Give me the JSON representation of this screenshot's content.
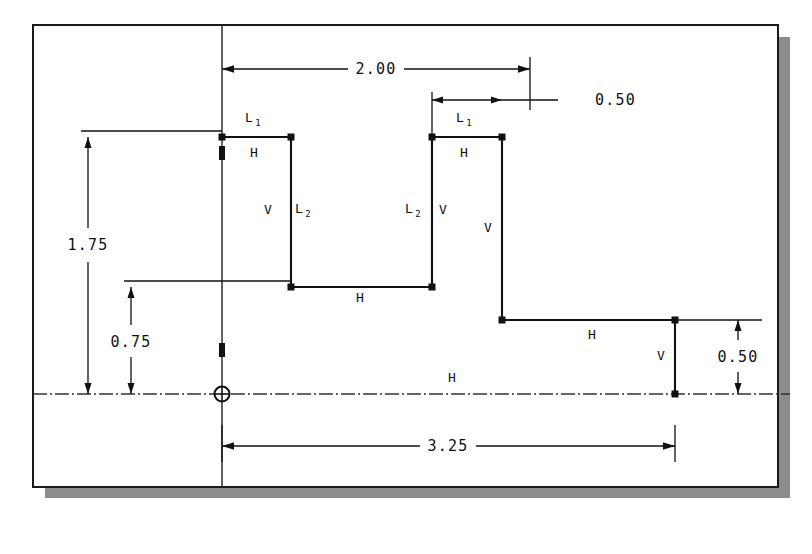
{
  "canvas": {
    "width": 812,
    "height": 554,
    "background": "#ffffff"
  },
  "window_frame": {
    "name": "cad-sketch-window",
    "border_color": "#1a1a1a",
    "shadow_color": "#8c8c8c",
    "x": 33,
    "y": 25,
    "width": 745,
    "height": 462,
    "shadow_offset": 12
  },
  "drawing": {
    "line_color": "#111111",
    "centerline_color": "#333333",
    "origin": {
      "x": 222,
      "y": 394,
      "label": "origin-symbol"
    },
    "axis_vertical": {
      "x": 222,
      "y1": 25,
      "y2": 487
    },
    "centerline_horizontal": {
      "y": 394,
      "x1": 33,
      "x2": 790
    },
    "profile_points": [
      {
        "x": 222,
        "y": 137
      },
      {
        "x": 291,
        "y": 137
      },
      {
        "x": 291,
        "y": 287
      },
      {
        "x": 432,
        "y": 287
      },
      {
        "x": 432,
        "y": 137
      },
      {
        "x": 502,
        "y": 137
      },
      {
        "x": 502,
        "y": 320
      },
      {
        "x": 675,
        "y": 320
      },
      {
        "x": 675,
        "y": 394
      }
    ]
  },
  "dimensions": [
    {
      "id": "dim-2-00",
      "label": "2.00",
      "orientation": "horizontal",
      "from_x": 222,
      "to_x": 530,
      "line_y": 69,
      "text_x": 376,
      "text_y": 74
    },
    {
      "id": "dim-0-50-top",
      "label": "0.50",
      "orientation": "horizontal",
      "from_x": 432,
      "to_x": 502,
      "line_y": 100,
      "text_x": 595,
      "text_y": 105,
      "leader_to_x": 558
    },
    {
      "id": "dim-1-75",
      "label": "1.75",
      "orientation": "vertical",
      "line_x": 88,
      "from_y": 137,
      "to_y": 394,
      "text_x": 88,
      "text_y": 248
    },
    {
      "id": "dim-0-75",
      "label": "0.75",
      "orientation": "vertical",
      "line_x": 131,
      "from_y": 287,
      "to_y": 394,
      "text_x": 131,
      "text_y": 345
    },
    {
      "id": "dim-3-25",
      "label": "3.25",
      "orientation": "horizontal",
      "from_x": 222,
      "to_x": 675,
      "line_y": 446,
      "text_x": 448,
      "text_y": 451
    },
    {
      "id": "dim-0-50-right",
      "label": "0.50",
      "orientation": "vertical",
      "line_x": 738,
      "from_y": 320,
      "to_y": 394,
      "text_x": 738,
      "text_y": 359
    }
  ],
  "constraints": [
    {
      "id": "c-L1-left",
      "label": "L",
      "sub": "1",
      "x": 249,
      "y": 122
    },
    {
      "id": "c-H-1",
      "label": "H",
      "sub": "",
      "x": 254,
      "y": 157
    },
    {
      "id": "c-V-1",
      "label": "V",
      "sub": "",
      "x": 268,
      "y": 214
    },
    {
      "id": "c-L2-left",
      "label": "L",
      "sub": "2",
      "x": 299,
      "y": 213
    },
    {
      "id": "c-H-2",
      "label": "H",
      "sub": "",
      "x": 360,
      "y": 302
    },
    {
      "id": "c-L2-right",
      "label": "L",
      "sub": "2",
      "x": 409,
      "y": 213
    },
    {
      "id": "c-V-2",
      "label": "V",
      "sub": "",
      "x": 443,
      "y": 214
    },
    {
      "id": "c-L1-right",
      "label": "L",
      "sub": "1",
      "x": 460,
      "y": 122
    },
    {
      "id": "c-H-3",
      "label": "H",
      "sub": "",
      "x": 464,
      "y": 157
    },
    {
      "id": "c-V-3",
      "label": "V",
      "sub": "",
      "x": 488,
      "y": 232
    },
    {
      "id": "c-H-4",
      "label": "H",
      "sub": "",
      "x": 592,
      "y": 339
    },
    {
      "id": "c-V-4",
      "label": "V",
      "sub": "",
      "x": 661,
      "y": 360
    },
    {
      "id": "c-H-5",
      "label": "H",
      "sub": "",
      "x": 452,
      "y": 382
    }
  ]
}
